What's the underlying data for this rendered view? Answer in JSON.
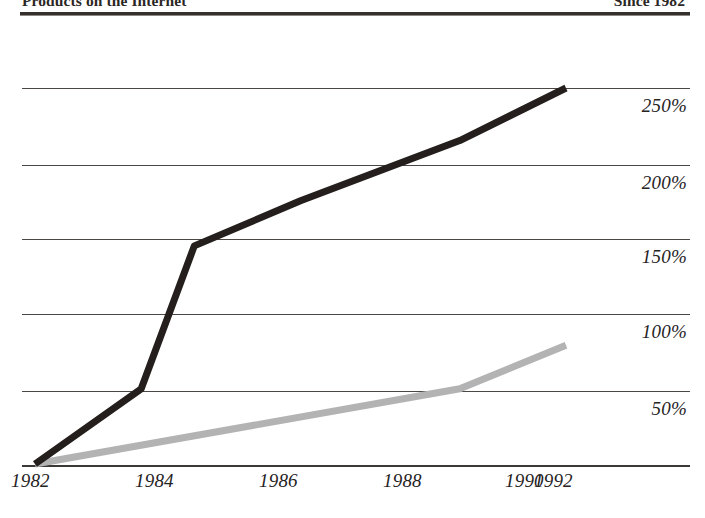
{
  "header": {
    "left_title": "Products on the Internet",
    "right_title": "Since 1982"
  },
  "chart_data": {
    "type": "line",
    "title": "Products on the Internet",
    "subtitle": "Since 1982",
    "xlabel": "",
    "ylabel": "",
    "grid": true,
    "legend": "none",
    "x": [
      1982,
      1984,
      1985,
      1987,
      1990,
      1992
    ],
    "xlim": [
      1982,
      1992.2
    ],
    "ylim": [
      0,
      260
    ],
    "xticks": [
      "1982",
      "1984",
      "1986",
      "1988",
      "1990",
      "1992"
    ],
    "xtick_values": [
      1982,
      1984,
      1986,
      1988,
      1990,
      1992
    ],
    "yticks": [
      "50%",
      "100%",
      "150%",
      "200%",
      "250%"
    ],
    "ytick_values": [
      50,
      100,
      150,
      200,
      250
    ],
    "series": [
      {
        "name": "Upper series",
        "color": "#241f1c",
        "x": [
          1982,
          1984,
          1985,
          1987,
          1990,
          1992
        ],
        "values": [
          0,
          50,
          145,
          175,
          215,
          250
        ]
      },
      {
        "name": "Lower series",
        "color": "#b3b3b3",
        "x": [
          1982,
          1990,
          1992
        ],
        "values": [
          0,
          50,
          79
        ]
      }
    ]
  },
  "y_axis": {
    "labels": [
      {
        "text": "250%",
        "top": 95
      },
      {
        "text": "200%",
        "top": 172
      },
      {
        "text": "150%",
        "top": 246
      },
      {
        "text": "100%",
        "top": 321
      },
      {
        "text": "50%",
        "top": 398
      }
    ]
  },
  "x_axis": {
    "labels": [
      {
        "text": "1982",
        "left": 11
      },
      {
        "text": "1984",
        "left": 135
      },
      {
        "text": "1986",
        "left": 259
      },
      {
        "text": "1988",
        "left": 383
      },
      {
        "text": "1990",
        "left": 505
      },
      {
        "text": "1992",
        "left": 534
      }
    ]
  },
  "gridlines": [
    {
      "top": 88
    },
    {
      "top": 165
    },
    {
      "top": 239
    },
    {
      "top": 314
    },
    {
      "top": 391
    }
  ]
}
